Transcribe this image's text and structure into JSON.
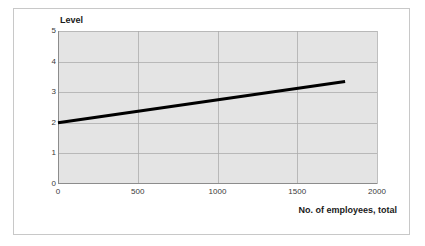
{
  "chart_data": {
    "type": "line",
    "title": "",
    "xlabel": "No. of employees, total",
    "ylabel": "Level",
    "xlim": [
      0,
      2000
    ],
    "ylim": [
      0,
      5
    ],
    "grid": true,
    "legend": false,
    "xticks": [
      "0",
      "500",
      "1000",
      "1500",
      "2000"
    ],
    "xtick_values": [
      0,
      500,
      1000,
      1500,
      2000
    ],
    "yticks": [
      "0",
      "1",
      "2",
      "3",
      "4",
      "5"
    ],
    "ytick_values": [
      0,
      1,
      2,
      3,
      4,
      5
    ],
    "series": [
      {
        "name": "Level trend",
        "color": "#000000",
        "line_width": 3,
        "x": [
          0,
          1800
        ],
        "values": [
          2.0,
          3.35
        ]
      }
    ]
  },
  "style": {
    "plot_background": "#e4e4e4",
    "gridline_color": "#a9a9a9",
    "axis_color": "#8c8c8c",
    "frame_color": "#c8c8c8",
    "page_background": "#ffffff",
    "text_color": "#3a3a3a"
  }
}
